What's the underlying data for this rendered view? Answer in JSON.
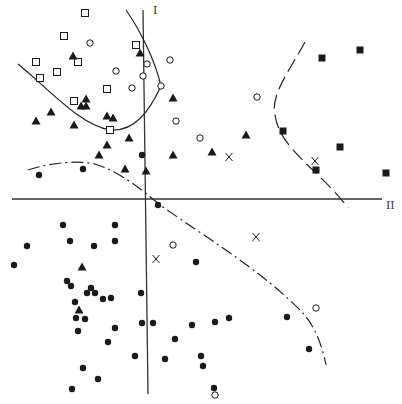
{
  "figure": {
    "type": "scatter-discriminant-plot",
    "axes": {
      "vertical_label": "I",
      "horizontal_label": "II"
    },
    "colors": {
      "ink": "#1a1a1a",
      "axis": "#333333",
      "background": "#ffffff"
    }
  },
  "chart_data": {
    "type": "scatter",
    "title": "",
    "xlabel": "II",
    "ylabel": "I",
    "grid": false,
    "legend": "none",
    "coordinate_space": "image pixels (402x404); horizontal axis at y=199, vertical axis near x=148",
    "series": [
      {
        "name": "open-square",
        "marker": "square-open",
        "points": [
          [
            85,
            13
          ],
          [
            64,
            36
          ],
          [
            36,
            62
          ],
          [
            78,
            62
          ],
          [
            40,
            78
          ],
          [
            57,
            72
          ],
          [
            107,
            89
          ],
          [
            136,
            45
          ],
          [
            74,
            101
          ],
          [
            110,
            130
          ]
        ]
      },
      {
        "name": "open-circle",
        "marker": "circle-open",
        "points": [
          [
            90,
            43
          ],
          [
            147,
            64
          ],
          [
            170,
            60
          ],
          [
            116,
            71
          ],
          [
            143,
            76
          ],
          [
            132,
            88
          ],
          [
            161,
            86
          ],
          [
            176,
            121
          ],
          [
            200,
            138
          ],
          [
            257,
            97
          ],
          [
            173,
            245
          ],
          [
            316,
            308
          ],
          [
            215,
            395
          ]
        ]
      },
      {
        "name": "filled-triangle",
        "marker": "triangle-filled",
        "points": [
          [
            73,
            56
          ],
          [
            140,
            53
          ],
          [
            86,
            99
          ],
          [
            81,
            106
          ],
          [
            86,
            106
          ],
          [
            51,
            112
          ],
          [
            36,
            121
          ],
          [
            74,
            125
          ],
          [
            107,
            116
          ],
          [
            113,
            118
          ],
          [
            173,
            98
          ],
          [
            129,
            138
          ],
          [
            107,
            145
          ],
          [
            99,
            155
          ],
          [
            125,
            169
          ],
          [
            146,
            171
          ],
          [
            173,
            155
          ],
          [
            212,
            152
          ],
          [
            246,
            135
          ],
          [
            82,
            267
          ],
          [
            79,
            310
          ]
        ]
      },
      {
        "name": "filled-circle",
        "marker": "circle-filled",
        "points": [
          [
            39,
            175
          ],
          [
            83,
            169
          ],
          [
            142,
            155
          ],
          [
            158,
            205
          ],
          [
            63,
            225
          ],
          [
            115,
            225
          ],
          [
            27,
            246
          ],
          [
            70,
            241
          ],
          [
            94,
            246
          ],
          [
            115,
            241
          ],
          [
            14,
            265
          ],
          [
            196,
            262
          ],
          [
            67,
            281
          ],
          [
            71,
            286
          ],
          [
            91,
            288
          ],
          [
            87,
            293
          ],
          [
            95,
            293
          ],
          [
            103,
            299
          ],
          [
            111,
            298
          ],
          [
            75,
            302
          ],
          [
            141,
            293
          ],
          [
            76,
            318
          ],
          [
            85,
            319
          ],
          [
            78,
            331
          ],
          [
            115,
            328
          ],
          [
            142,
            323
          ],
          [
            153,
            323
          ],
          [
            192,
            325
          ],
          [
            215,
            322
          ],
          [
            229,
            318
          ],
          [
            175,
            339
          ],
          [
            108,
            342
          ],
          [
            201,
            356
          ],
          [
            287,
            317
          ],
          [
            135,
            356
          ],
          [
            83,
            368
          ],
          [
            98,
            379
          ],
          [
            72,
            389
          ],
          [
            214,
            388
          ],
          [
            203,
            366
          ],
          [
            309,
            349
          ],
          [
            165,
            359
          ]
        ]
      },
      {
        "name": "x-mark",
        "marker": "x",
        "points": [
          [
            229,
            157
          ],
          [
            315,
            161
          ],
          [
            156,
            259
          ],
          [
            256,
            237
          ]
        ]
      },
      {
        "name": "filled-square",
        "marker": "square-filled",
        "points": [
          [
            322,
            58
          ],
          [
            360,
            50
          ],
          [
            283,
            131
          ],
          [
            340,
            147
          ],
          [
            316,
            170
          ],
          [
            386,
            173
          ]
        ]
      }
    ],
    "boundaries": [
      {
        "name": "solid-boundary-upper-left",
        "style": "solid",
        "description": "U-shaped curve enclosing open squares, vertex near (110,130), rising to (161,86) and up to (126,10)"
      },
      {
        "name": "dashed-boundary-right",
        "style": "long-dash",
        "description": "C-shaped curve from (305,42) bending left to (273,110) then down to (348,208)"
      },
      {
        "name": "dash-dot-boundary-lower",
        "style": "dash-dot",
        "description": "Arc from (28,170) peaking near (75,163) descending through (150,195) to (326,365)"
      }
    ],
    "axis_lines": {
      "horizontal": {
        "from": [
          12,
          199
        ],
        "to": [
          382,
          199
        ]
      },
      "vertical": {
        "from": [
          143,
          10
        ],
        "to": [
          148,
          394
        ]
      }
    }
  }
}
